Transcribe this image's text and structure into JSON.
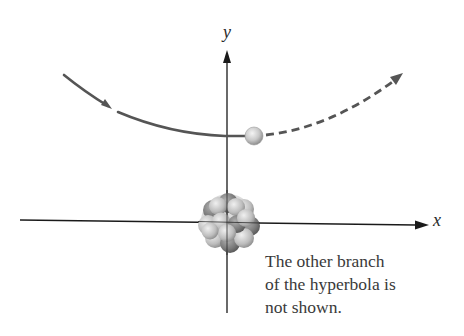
{
  "diagram": {
    "axes": {
      "x_label": "x",
      "y_label": "y"
    },
    "caption": {
      "lines": [
        "The other branch",
        "of the hyperbola is",
        "not shown."
      ]
    },
    "elements": {
      "trajectory_solid": "incoming path (solid hyperbola branch)",
      "trajectory_dashed": "outgoing path (dashed hyperbola branch)",
      "particle": "alpha particle",
      "nucleus": "nucleus cluster at origin"
    },
    "colors": {
      "axis": "#1a1a1a",
      "curve": "#555555",
      "particle_light": "#e8e8e8",
      "particle_dark": "#9a9a9a",
      "nucleus_light": "#d6d6d6",
      "nucleus_dark": "#6e6e6e",
      "text": "#3a3a3a"
    }
  }
}
